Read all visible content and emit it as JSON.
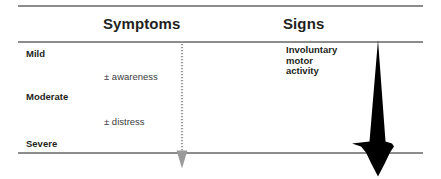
{
  "figure": {
    "background_color": "#ffffff",
    "rule_color": "#8c8c8c"
  },
  "columns": {
    "symptoms_heading": "Symptoms",
    "signs_heading": "Signs"
  },
  "severity_axis": {
    "levels": [
      {
        "label": "Mild"
      },
      {
        "label": "Moderate"
      },
      {
        "label": "Severe"
      }
    ]
  },
  "symptoms": {
    "items": [
      {
        "label": "± awareness"
      },
      {
        "label": "± distress"
      }
    ]
  },
  "signs": {
    "note_lines": [
      "Involuntary",
      "motor",
      "activity"
    ]
  },
  "arrows": {
    "symptom_arrow": {
      "name": "dotted-down-arrow",
      "style": "dotted",
      "color": "#9a9a9a",
      "direction": "down"
    },
    "signs_arrow": {
      "name": "solid-down-arrow",
      "style": "solid",
      "color": "#000000",
      "direction": "down"
    }
  }
}
